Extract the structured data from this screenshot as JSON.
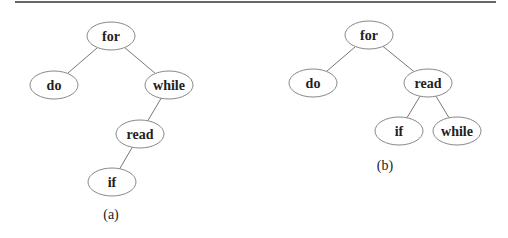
{
  "top_rule": {
    "x1": 15,
    "x2": 496,
    "y": 2,
    "color": "#666666"
  },
  "trees": [
    {
      "caption": "(a)",
      "caption_pos": {
        "x": 111,
        "y": 219
      },
      "nodes": [
        {
          "id": "for",
          "label": "for",
          "cx": 111,
          "cy": 36
        },
        {
          "id": "do",
          "label": "do",
          "cx": 54,
          "cy": 85
        },
        {
          "id": "while",
          "label": "while",
          "cx": 169,
          "cy": 85
        },
        {
          "id": "read",
          "label": "read",
          "cx": 140,
          "cy": 134
        },
        {
          "id": "if",
          "label": "if",
          "cx": 112,
          "cy": 182
        }
      ],
      "edges": [
        [
          "for",
          "do"
        ],
        [
          "for",
          "while"
        ],
        [
          "while",
          "read"
        ],
        [
          "read",
          "if"
        ]
      ]
    },
    {
      "caption": "(b)",
      "caption_pos": {
        "x": 385,
        "y": 170
      },
      "nodes": [
        {
          "id": "for",
          "label": "for",
          "cx": 369,
          "cy": 35
        },
        {
          "id": "do",
          "label": "do",
          "cx": 313,
          "cy": 83
        },
        {
          "id": "read",
          "label": "read",
          "cx": 428,
          "cy": 83
        },
        {
          "id": "if",
          "label": "if",
          "cx": 399,
          "cy": 131
        },
        {
          "id": "while",
          "label": "while",
          "cx": 457,
          "cy": 131
        }
      ],
      "edges": [
        [
          "for",
          "do"
        ],
        [
          "for",
          "read"
        ],
        [
          "read",
          "if"
        ],
        [
          "read",
          "while"
        ]
      ]
    }
  ],
  "node_rx": 24,
  "node_ry": 14
}
